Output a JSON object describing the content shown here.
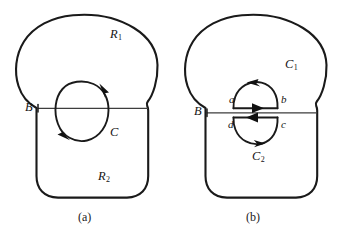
{
  "figure": {
    "background_color": "#ffffff",
    "stroke_color": "#1a1a1a",
    "line_color": "#3d3d3d"
  },
  "panels": [
    {
      "id": "a",
      "caption": "(a)",
      "labels": {
        "upper_region": "R",
        "upper_region_sub": "1",
        "lower_region": "R",
        "lower_region_sub": "2",
        "boundary_line": "B",
        "inner_curve": "C"
      }
    },
    {
      "id": "b",
      "caption": "(b)",
      "labels": {
        "boundary_line": "B",
        "upper_curve": "C",
        "upper_curve_sub": "1",
        "lower_curve": "C",
        "lower_curve_sub": "2",
        "corner_a": "a",
        "corner_b": "b",
        "corner_c": "c",
        "corner_d": "d"
      }
    }
  ]
}
